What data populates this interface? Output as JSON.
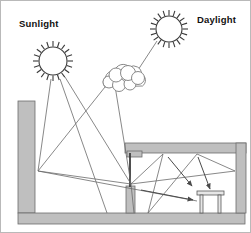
{
  "diagram": {
    "type": "architectural-lighting-section",
    "background_color": "#ffffff",
    "border_color": "#b9b9b9",
    "labels": [
      {
        "id": "sunlight",
        "text": "Sunlight",
        "x": 18,
        "y": 26,
        "color": "#111111"
      },
      {
        "id": "daylight",
        "text": "Daylight",
        "x": 196,
        "y": 22,
        "color": "#111111"
      }
    ],
    "suns": [
      {
        "id": "sunlight-sun",
        "cx": 52,
        "cy": 60,
        "radius": 14,
        "spike_count": 20,
        "spike_length": 6
      },
      {
        "id": "daylight-sun",
        "cx": 168,
        "cy": 28,
        "radius": 13,
        "spike_count": 20,
        "spike_length": 6
      }
    ],
    "cloud": {
      "id": "cloud",
      "cx": 122,
      "cy": 76,
      "width": 46,
      "height": 26
    },
    "structures": [
      {
        "id": "left-wall",
        "shape": "rect",
        "x": 17,
        "y": 100,
        "width": 17,
        "height": 112,
        "fill": "#bfbfbf"
      },
      {
        "id": "ground-slab",
        "shape": "rect",
        "x": 17,
        "y": 212,
        "width": 227,
        "height": 11,
        "fill": "#bfbfbf"
      },
      {
        "id": "roof-slab",
        "shape": "rect",
        "x": 124,
        "y": 142,
        "width": 121,
        "height": 10,
        "fill": "#bfbfbf"
      },
      {
        "id": "right-wall",
        "shape": "rect",
        "x": 235,
        "y": 142,
        "width": 10,
        "height": 70,
        "fill": "#bfbfbf"
      },
      {
        "id": "light-shelf",
        "shape": "rect",
        "x": 126,
        "y": 150,
        "width": 14,
        "height": 6,
        "fill": "#bfbfbf"
      },
      {
        "id": "window-spandrel",
        "shape": "rect",
        "x": 125,
        "y": 185,
        "width": 9,
        "height": 27,
        "fill": "#bfbfbf"
      },
      {
        "id": "window-mullion",
        "shape": "line",
        "x1": 129,
        "y1": 152,
        "x2": 129,
        "y2": 186
      }
    ],
    "furniture": {
      "id": "desk",
      "top": {
        "x": 196,
        "y": 190,
        "width": 27,
        "height": 4
      },
      "legs": [
        {
          "x": 199,
          "y": 194,
          "width": 3,
          "height": 18
        },
        {
          "x": 217,
          "y": 194,
          "width": 3,
          "height": 18
        }
      ]
    },
    "rays": [
      {
        "id": "sun-direct-to-window-node",
        "points": "64,76 130,183"
      },
      {
        "id": "sun-direct-to-floor",
        "points": "59,78 106,212"
      },
      {
        "id": "sun-to-left-wall-reflect",
        "points": "50,78 37,170"
      },
      {
        "id": "left-wall-reflect-to-window",
        "points": "37,170 130,183"
      },
      {
        "id": "left-wall-reflect-to-room-floor",
        "points": "37,170 196,200"
      },
      {
        "id": "daylight-to-cloud",
        "points": "156,40 136,70"
      },
      {
        "id": "cloud-diffuse-to-window",
        "points": "112,84 130,183"
      },
      {
        "id": "cloud-diffuse-through-window",
        "points": "103,86 37,170"
      },
      {
        "id": "interior-bounce-1",
        "points": "130,183 162,152"
      },
      {
        "id": "interior-bounce-2",
        "points": "162,152 147,212"
      },
      {
        "id": "interior-bounce-3",
        "points": "147,212 196,152"
      },
      {
        "id": "interior-bounce-4",
        "points": "196,152 235,170"
      },
      {
        "id": "interior-bounce-5",
        "points": "235,170 130,183"
      },
      {
        "id": "window-node-to-floor-left",
        "points": "130,183 133,212"
      }
    ],
    "arrows": [
      {
        "id": "arrow-to-desk-left",
        "from": "166,155",
        "to": "191,186"
      },
      {
        "id": "arrow-to-desk-right",
        "from": "196,155",
        "to": "209,189"
      },
      {
        "id": "arrow-floor-right",
        "from": "140,188",
        "to": "193,199"
      }
    ],
    "colors": {
      "masonry_fill": "#bfbfbf",
      "masonry_stroke": "#6d6d6d",
      "ray_stroke": "#6a6a6a",
      "ink": "#3a3a3a",
      "label": "#111111",
      "page": "#ffffff"
    }
  }
}
